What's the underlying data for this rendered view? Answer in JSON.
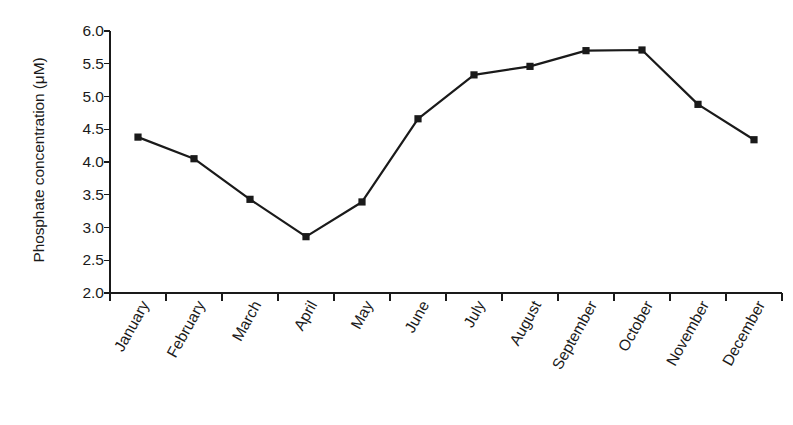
{
  "chart_data": {
    "type": "line",
    "title": "",
    "xlabel": "",
    "ylabel": "Phosphate concentration (μM)",
    "categories": [
      "January",
      "February",
      "March",
      "April",
      "May",
      "June",
      "July",
      "August",
      "September",
      "October",
      "November",
      "December"
    ],
    "values": [
      4.38,
      4.05,
      3.43,
      2.86,
      3.39,
      4.66,
      5.33,
      5.46,
      5.7,
      5.71,
      4.88,
      4.34
    ],
    "series": [
      {
        "name": "Phosphate concentration",
        "values": [
          4.38,
          4.05,
          3.43,
          2.86,
          3.39,
          4.66,
          5.33,
          5.46,
          5.7,
          5.71,
          4.88,
          4.34
        ]
      }
    ],
    "ylim": [
      2.0,
      6.0
    ],
    "y_ticks": [
      "2.0",
      "2.5",
      "3.0",
      "3.5",
      "4.0",
      "4.5",
      "5.0",
      "5.5",
      "6.0"
    ],
    "y_tick_values": [
      2.0,
      2.5,
      3.0,
      3.5,
      4.0,
      4.5,
      5.0,
      5.5,
      6.0
    ],
    "grid": false,
    "legend": false,
    "legend_position": "none",
    "marker": "square",
    "line_color": "#1a1a1a",
    "marker_color": "#1a1a1a",
    "background_color": "#ffffff",
    "axis_color": "#1a1a1a"
  }
}
